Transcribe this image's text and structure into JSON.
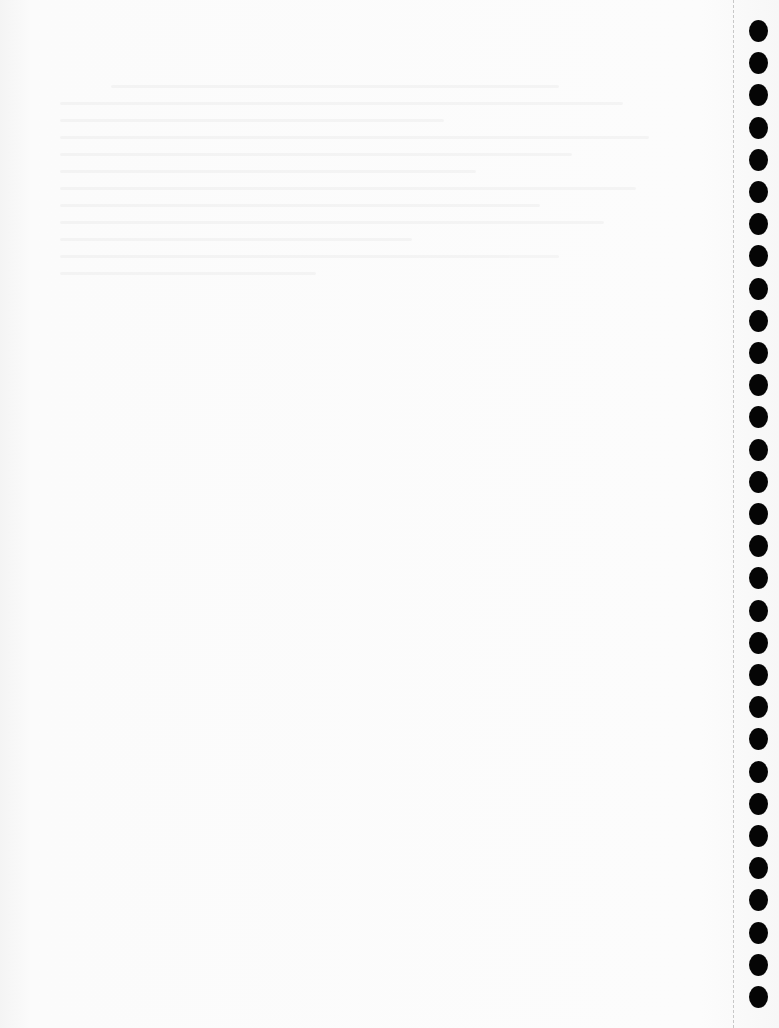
{
  "page": {
    "type": "scanned-blank-notebook-page",
    "background_color": "#fbfbfb",
    "text_content": "",
    "bleed_through": "faint illegible reverse-side text"
  },
  "binding": {
    "hole_count": 31,
    "hole_color": "#050505",
    "perforation_line": "dashed"
  }
}
